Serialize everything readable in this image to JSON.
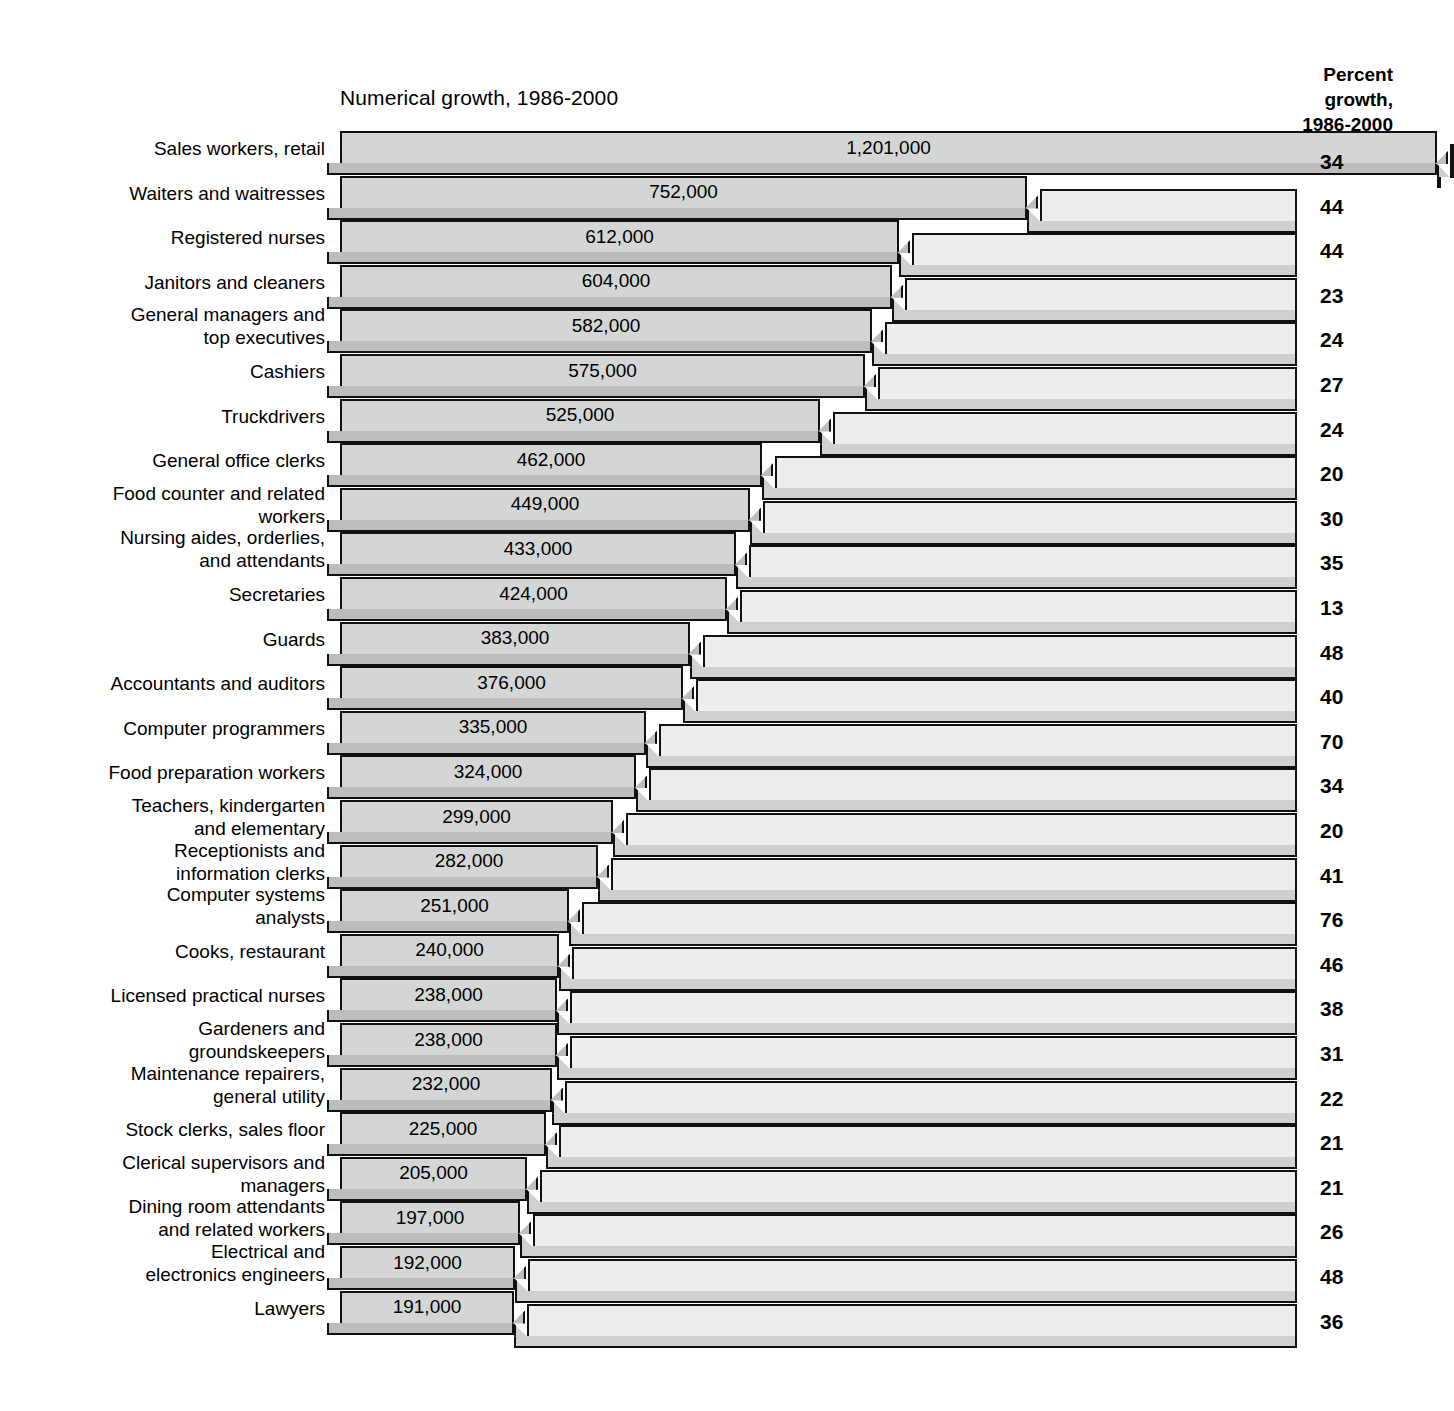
{
  "header": {
    "numeric_title": "Numerical growth, 1986-2000",
    "percent_title_line1": "Percent",
    "percent_title_line2": "growth,",
    "percent_title_line3": "1986-2000"
  },
  "chart_data": {
    "type": "bar",
    "title": "Numerical growth, 1986-2000",
    "secondary_title": "Percent growth, 1986-2000",
    "xlabel": "",
    "ylabel": "",
    "orientation": "horizontal",
    "grid": false,
    "legend": null,
    "xlim": [
      0,
      1201000
    ],
    "categories": [
      "Sales workers, retail",
      "Waiters and waitresses",
      "Registered nurses",
      "Janitors and cleaners",
      "General managers and\ntop executives",
      "Cashiers",
      "Truckdrivers",
      "General office clerks",
      "Food counter and related\nworkers",
      "Nursing aides, orderlies,\nand attendants",
      "Secretaries",
      "Guards",
      "Accountants and auditors",
      "Computer programmers",
      "Food preparation workers",
      "Teachers, kindergarten\nand elementary",
      "Receptionists and\ninformation clerks",
      "Computer systems\nanalysts",
      "Cooks, restaurant",
      "Licensed practical nurses",
      "Gardeners and\ngroundskeepers",
      "Maintenance repairers,\ngeneral utility",
      "Stock clerks, sales floor",
      "Clerical supervisors and\nmanagers",
      "Dining room attendants\nand related workers",
      "Electrical and\nelectronics engineers",
      "Lawyers"
    ],
    "series": [
      {
        "name": "Numerical growth, 1986-2000",
        "values": [
          1201000,
          752000,
          612000,
          604000,
          582000,
          575000,
          525000,
          462000,
          449000,
          433000,
          424000,
          383000,
          376000,
          335000,
          324000,
          299000,
          282000,
          251000,
          240000,
          238000,
          238000,
          232000,
          225000,
          205000,
          197000,
          192000,
          191000
        ],
        "labels": [
          "1,201,000",
          "752,000",
          "612,000",
          "604,000",
          "582,000",
          "575,000",
          "525,000",
          "462,000",
          "449,000",
          "433,000",
          "424,000",
          "383,000",
          "376,000",
          "335,000",
          "324,000",
          "299,000",
          "282,000",
          "251,000",
          "240,000",
          "238,000",
          "238,000",
          "232,000",
          "225,000",
          "205,000",
          "197,000",
          "192,000",
          "191,000"
        ]
      },
      {
        "name": "Percent growth, 1986-2000",
        "values": [
          34,
          44,
          44,
          23,
          24,
          27,
          24,
          20,
          30,
          35,
          13,
          48,
          40,
          70,
          34,
          20,
          41,
          76,
          46,
          38,
          31,
          22,
          21,
          21,
          26,
          48,
          36
        ],
        "labels": [
          "34",
          "44",
          "44",
          "23",
          "24",
          "27",
          "24",
          "20",
          "30",
          "35",
          "13",
          "48",
          "40",
          "70",
          "34",
          "20",
          "41",
          "76",
          "46",
          "38",
          "31",
          "22",
          "21",
          "21",
          "26",
          "48",
          "36"
        ]
      }
    ]
  },
  "colors": {
    "numeric_bar_face": "#d4d5d5",
    "numeric_bar_side": "#bcbdbd",
    "percent_bar_face": "#eceded",
    "percent_bar_side": "#cfd0d0",
    "outline": "#111111",
    "background": "#ffffff"
  }
}
